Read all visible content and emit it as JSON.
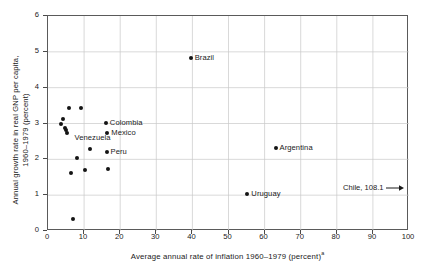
{
  "chart_data": {
    "type": "scatter",
    "title": "",
    "xlabel": "Average annual rate of inflation 1960–1979 (percent)",
    "xlabel_superscript": "a",
    "ylabel_line1": "Annual growth rate in real GNP per capita,",
    "ylabel_line2": "1960–1979 (percent)",
    "xlim": [
      0,
      100
    ],
    "ylim": [
      0,
      6
    ],
    "xticks": [
      0,
      10,
      20,
      30,
      40,
      50,
      60,
      70,
      80,
      90,
      100
    ],
    "yticks": [
      0,
      1,
      2,
      3,
      4,
      5,
      6
    ],
    "grid": true,
    "legend": "none",
    "points": [
      {
        "label": "",
        "x": 3.8,
        "y": 2.95
      },
      {
        "label": "",
        "x": 4.3,
        "y": 3.1
      },
      {
        "label": "",
        "x": 5.0,
        "y": 2.85
      },
      {
        "label": "",
        "x": 5.2,
        "y": 2.78
      },
      {
        "label": "",
        "x": 5.6,
        "y": 2.72
      },
      {
        "label": "",
        "x": 6.2,
        "y": 3.4
      },
      {
        "label": "",
        "x": 6.6,
        "y": 1.6
      },
      {
        "label": "",
        "x": 7.2,
        "y": 0.3
      },
      {
        "label": "",
        "x": 8.4,
        "y": 2.0
      },
      {
        "label": "",
        "x": 9.4,
        "y": 3.4
      },
      {
        "label": "",
        "x": 10.6,
        "y": 1.68
      },
      {
        "label": "",
        "x": 12.0,
        "y": 2.27
      },
      {
        "label": "Colombia",
        "x": 16.3,
        "y": 3.0
      },
      {
        "label": "Mexico",
        "x": 16.7,
        "y": 2.72
      },
      {
        "label": "Peru",
        "x": 16.5,
        "y": 2.18
      },
      {
        "label": "",
        "x": 16.8,
        "y": 1.7
      },
      {
        "label": "Brazil",
        "x": 39.8,
        "y": 4.8
      },
      {
        "label": "Uruguay",
        "x": 55.5,
        "y": 1.0
      },
      {
        "label": "Argentina",
        "x": 63.3,
        "y": 2.3
      }
    ],
    "floating_labels": [
      {
        "text": "Venezuela",
        "x": 7.6,
        "y": 2.57
      }
    ],
    "annotations": [
      {
        "name": "chile-offscale",
        "text": "Chile, 108.1",
        "arrow": "right",
        "x": 82.0,
        "y": 1.3
      }
    ]
  }
}
